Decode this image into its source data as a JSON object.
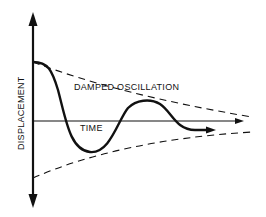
{
  "diagram": {
    "y_axis_label": "DISPLACEMENT",
    "x_axis_label": "TIME",
    "curve_label": "DAMPED OSCILLATION",
    "colors": {
      "ink": "#111111",
      "background": "#ffffff"
    }
  }
}
